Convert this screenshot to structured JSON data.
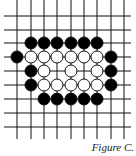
{
  "figure": {
    "caption": "Figure C.",
    "grid": {
      "columns_x": [
        17,
        31,
        44,
        57,
        71,
        84,
        97,
        111,
        124
      ],
      "rows_y": [
        16,
        30,
        43,
        57,
        71,
        85,
        99,
        113,
        127
      ],
      "h_line_extent": [
        4,
        131
      ],
      "v_line_extent": [
        0,
        139
      ],
      "line_color": "#111111"
    },
    "stone_radius": 6,
    "colors": {
      "black": "#000000",
      "white": "#ffffff",
      "outline": "#111111"
    },
    "black_stones": [
      [
        1,
        2
      ],
      [
        2,
        2
      ],
      [
        3,
        2
      ],
      [
        4,
        2
      ],
      [
        5,
        2
      ],
      [
        6,
        2
      ],
      [
        0,
        3
      ],
      [
        7,
        3
      ],
      [
        1,
        4
      ],
      [
        7,
        4
      ],
      [
        1,
        5
      ],
      [
        7,
        5
      ],
      [
        2,
        6
      ],
      [
        3,
        6
      ],
      [
        4,
        6
      ],
      [
        5,
        6
      ],
      [
        6,
        6
      ]
    ],
    "white_stones": [
      [
        1,
        3
      ],
      [
        2,
        3
      ],
      [
        3,
        3
      ],
      [
        4,
        3
      ],
      [
        5,
        3
      ],
      [
        6,
        3
      ],
      [
        2,
        4
      ],
      [
        4,
        4
      ],
      [
        6,
        4
      ],
      [
        2,
        5
      ],
      [
        3,
        5
      ],
      [
        4,
        5
      ],
      [
        5,
        5
      ],
      [
        6,
        5
      ]
    ]
  }
}
